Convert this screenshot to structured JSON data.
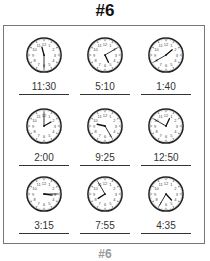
{
  "title": "#6",
  "footer": "#6",
  "clocks": [
    {
      "time": "11:30",
      "hour": 11,
      "minute": 30,
      "cx": 44,
      "cy": 55
    },
    {
      "time": "5:10",
      "hour": 5,
      "minute": 10,
      "cx": 105,
      "cy": 55
    },
    {
      "time": "1:40",
      "hour": 1,
      "minute": 40,
      "cx": 166,
      "cy": 55
    },
    {
      "time": "2:00",
      "hour": 2,
      "minute": 0,
      "cx": 44,
      "cy": 126
    },
    {
      "time": "9:25",
      "hour": 9,
      "minute": 25,
      "cx": 105,
      "cy": 126
    },
    {
      "time": "12:50",
      "hour": 12,
      "minute": 50,
      "cx": 166,
      "cy": 126
    },
    {
      "time": "3:15",
      "hour": 3,
      "minute": 15,
      "cx": 44,
      "cy": 194
    },
    {
      "time": "7:55",
      "hour": 7,
      "minute": 55,
      "cx": 105,
      "cy": 194
    },
    {
      "time": "4:35",
      "hour": 4,
      "minute": 35,
      "cx": 166,
      "cy": 194
    }
  ]
}
